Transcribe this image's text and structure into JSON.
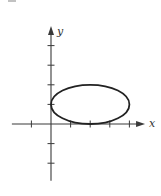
{
  "figure": {
    "colors": {
      "background": "#ffffff",
      "axis": "#3a3a3a",
      "curve": "#222222"
    }
  },
  "chart_data": {
    "type": "line",
    "title": "",
    "xlabel": "x",
    "ylabel": "y",
    "grid": false,
    "legend": null,
    "xlim": [
      -2.2,
      4.8
    ],
    "ylim": [
      -2.9,
      5.0
    ],
    "x_ticks": [
      -1,
      0,
      1,
      2,
      3,
      4
    ],
    "y_ticks": [
      -2,
      -1,
      1,
      2,
      3,
      4
    ],
    "tick_labels_shown": false,
    "series": [
      {
        "name": "ellipse",
        "shape": "ellipse",
        "equation": "(x-2)^2/4 + (y-1)^2 = 1",
        "center": [
          2,
          1
        ],
        "semi_axis_x": 2,
        "semi_axis_y": 1,
        "key_points": [
          [
            0,
            1
          ],
          [
            4,
            1
          ],
          [
            2,
            2
          ],
          [
            2,
            0
          ]
        ]
      }
    ]
  }
}
